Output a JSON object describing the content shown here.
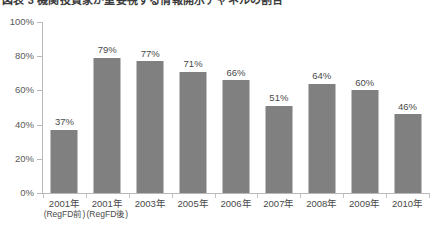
{
  "figure": {
    "title_partial": "図表 3  機関投資家が重要視する情報開示チャネルの割合",
    "title_clipped": true
  },
  "chart_data": {
    "type": "bar",
    "title": "",
    "xlabel": "",
    "ylabel": "",
    "ylim": [
      0,
      100
    ],
    "yticks": [
      0,
      20,
      40,
      60,
      80,
      100
    ],
    "ytick_labels": [
      "0%",
      "20%",
      "40%",
      "60%",
      "80%",
      "100%"
    ],
    "grid": false,
    "legend": false,
    "bar_color": "#808080",
    "axis_color": "#b9b9b9",
    "label_suffix": "%",
    "categories": [
      "2001年",
      "2001年",
      "2003年",
      "2005年",
      "2006年",
      "2007年",
      "2008年",
      "2009年",
      "2010年"
    ],
    "category_sublabels": [
      "(RegFD前)",
      "(RegFD後)",
      "",
      "",
      "",
      "",
      "",
      "",
      ""
    ],
    "values": [
      37,
      79,
      77,
      71,
      66,
      51,
      64,
      60,
      46
    ],
    "value_labels": [
      "37%",
      "79%",
      "77%",
      "71%",
      "66%",
      "51%",
      "64%",
      "60%",
      "46%"
    ]
  }
}
